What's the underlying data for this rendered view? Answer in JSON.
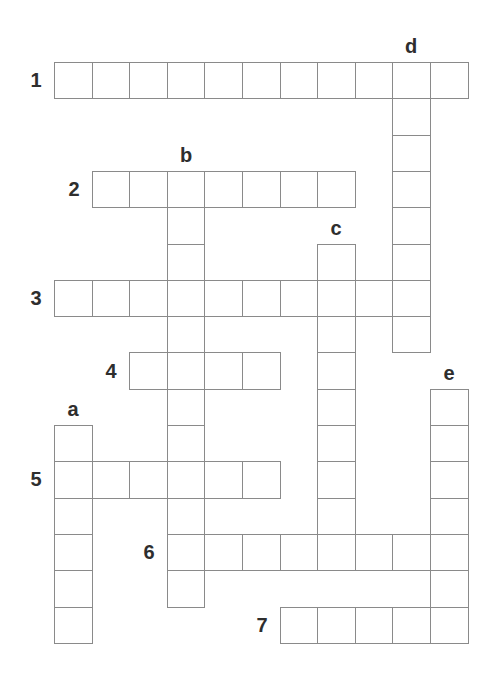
{
  "puzzle": {
    "type": "crossword",
    "grid": {
      "origin_x": 54,
      "origin_y": 62,
      "cell_w": 37.6,
      "cell_h": 36.3,
      "columns": 11,
      "rows": 16
    },
    "across": [
      {
        "label": "1",
        "row": 0,
        "col": 0,
        "length": 11
      },
      {
        "label": "2",
        "row": 3,
        "col": 1,
        "length": 7
      },
      {
        "label": "3",
        "row": 6,
        "col": 0,
        "length": 10
      },
      {
        "label": "4",
        "row": 8,
        "col": 2,
        "length": 4
      },
      {
        "label": "5",
        "row": 11,
        "col": 0,
        "length": 6
      },
      {
        "label": "6",
        "row": 13,
        "col": 3,
        "length": 8
      },
      {
        "label": "7",
        "row": 15,
        "col": 6,
        "length": 5
      }
    ],
    "down": [
      {
        "label": "a",
        "row": 10,
        "col": 0,
        "length": 6
      },
      {
        "label": "b",
        "row": 3,
        "col": 3,
        "length": 12
      },
      {
        "label": "c",
        "row": 5,
        "col": 7,
        "length": 9
      },
      {
        "label": "d",
        "row": 0,
        "col": 9,
        "length": 8
      },
      {
        "label": "e",
        "row": 9,
        "col": 10,
        "length": 7
      }
    ],
    "colors": {
      "grid_line": "#8a8a8a",
      "label": "#2e2e2e",
      "background": "#ffffff"
    }
  }
}
